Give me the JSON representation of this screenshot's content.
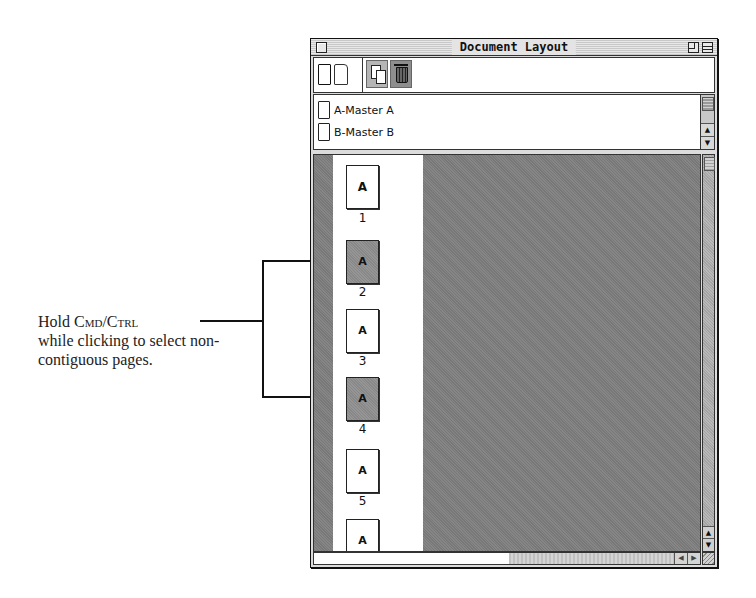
{
  "callout": {
    "line1_prefix": "Hold ",
    "key1": "Cmd",
    "separator": "/",
    "key2": "Ctrl",
    "rest": "while clicking to select non-contiguous pages."
  },
  "window": {
    "title": "Document Layout",
    "toolbar": {
      "blank_single_page_icon": "single-page-icon",
      "blank_facing_page_icon": "facing-page-icon",
      "duplicate_icon": "duplicate-icon",
      "delete_icon": "trash-icon"
    },
    "masters": [
      {
        "label": "A-Master A"
      },
      {
        "label": "B-Master B"
      }
    ],
    "pages": [
      {
        "master": "A",
        "number": "1",
        "selected": false
      },
      {
        "master": "A",
        "number": "2",
        "selected": true
      },
      {
        "master": "A",
        "number": "3",
        "selected": false
      },
      {
        "master": "A",
        "number": "4",
        "selected": true
      },
      {
        "master": "A",
        "number": "5",
        "selected": false
      },
      {
        "master": "A",
        "number": "",
        "selected": false
      }
    ],
    "scroll_arrows": {
      "up": "▲",
      "down": "▼",
      "left": "◀",
      "right": "▶"
    }
  }
}
